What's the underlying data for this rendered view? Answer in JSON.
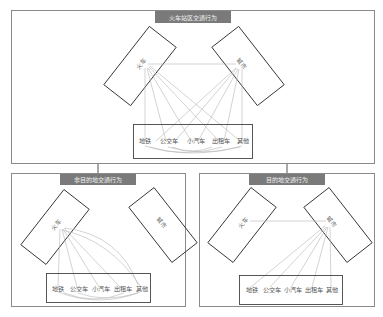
{
  "panels": {
    "top": {
      "title": "火车站区交通行为",
      "node_left": "火车",
      "node_right": "城市",
      "modes": [
        "地铁",
        "公交车",
        "小汽车",
        "出租车",
        "其他"
      ]
    },
    "bottom_left": {
      "title": "非目的地交通行为",
      "node_left": "火车",
      "node_right": "城市",
      "modes": [
        "地铁",
        "公交车",
        "小汽车",
        "出租车",
        "其他"
      ]
    },
    "bottom_right": {
      "title": "目的地交通行为",
      "node_left": "火车",
      "node_right": "城市",
      "modes": [
        "地铁",
        "公交车",
        "小汽车",
        "出租车",
        "其他"
      ]
    }
  },
  "colors": {
    "title_bg": "#7a7a7a",
    "border": "#8a8a8a",
    "edge": "#b5b5b5"
  }
}
